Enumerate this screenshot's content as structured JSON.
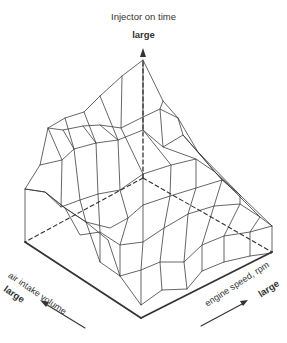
{
  "diagram": {
    "type": "3d-surface-map",
    "z_axis": {
      "label": "Injector on time",
      "direction_label": "large"
    },
    "left_axis": {
      "label": "air intake volume",
      "direction_label": "large"
    },
    "right_axis": {
      "label": "engine speed, rpm",
      "direction_label": "large"
    },
    "colors": {
      "line": "#333333",
      "background": "#ffffff"
    }
  }
}
